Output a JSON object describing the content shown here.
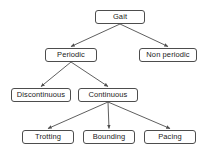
{
  "diagram": {
    "background_color": "#ffffff",
    "node_fill": "#ffffff",
    "node_border_color": "#4d4d4d",
    "edge_color": "#4d4d4d",
    "text_color": "#1a1a1a",
    "nodes": [
      {
        "id": "gait",
        "label": "Gait",
        "x": 95,
        "y": 10,
        "w": 50,
        "h": 14,
        "level": 0
      },
      {
        "id": "periodic",
        "label": "Periodic",
        "x": 45,
        "y": 48,
        "w": 52,
        "h": 14,
        "level": 1
      },
      {
        "id": "non-periodic",
        "label": "Non periodic",
        "x": 139,
        "y": 48,
        "w": 58,
        "h": 14,
        "level": 1
      },
      {
        "id": "discontinuous",
        "label": "Discontinuous",
        "x": 11,
        "y": 88,
        "w": 60,
        "h": 14,
        "level": 2
      },
      {
        "id": "continuous",
        "label": "Continuous",
        "x": 78,
        "y": 88,
        "w": 60,
        "h": 14,
        "level": 2
      },
      {
        "id": "trotting",
        "label": "Trotting",
        "x": 22,
        "y": 130,
        "w": 52,
        "h": 14,
        "level": 3
      },
      {
        "id": "bounding",
        "label": "Bounding",
        "x": 83,
        "y": 130,
        "w": 52,
        "h": 14,
        "level": 3
      },
      {
        "id": "pacing",
        "label": "Pacing",
        "x": 144,
        "y": 130,
        "w": 52,
        "h": 14,
        "level": 3
      }
    ],
    "edges": [
      {
        "from": "gait",
        "to": "periodic",
        "arrow": true
      },
      {
        "from": "gait",
        "to": "non-periodic",
        "arrow": true
      },
      {
        "from": "periodic",
        "to": "discontinuous",
        "arrow": true
      },
      {
        "from": "periodic",
        "to": "continuous",
        "arrow": true
      },
      {
        "from": "continuous",
        "to": "trotting",
        "arrow": true
      },
      {
        "from": "continuous",
        "to": "bounding",
        "arrow": true
      },
      {
        "from": "continuous",
        "to": "pacing",
        "arrow": true
      }
    ]
  }
}
